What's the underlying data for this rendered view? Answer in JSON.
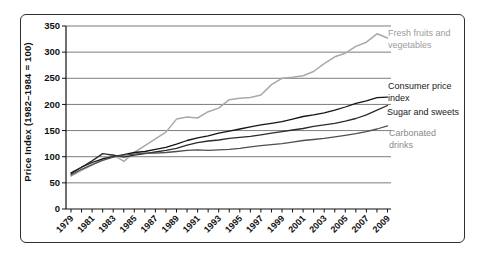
{
  "chart_data": {
    "type": "line",
    "title": "",
    "xlabel": "",
    "ylabel": "Price Index (1982–1984 = 100)",
    "ylim": [
      0,
      350
    ],
    "y_ticks": [
      0,
      50,
      100,
      150,
      200,
      250,
      300,
      350
    ],
    "grid": "horizontal",
    "legend_position": "right-of-line-annotations",
    "years": [
      1979,
      1980,
      1981,
      1982,
      1983,
      1984,
      1985,
      1986,
      1987,
      1988,
      1989,
      1990,
      1991,
      1992,
      1993,
      1994,
      1995,
      1996,
      1997,
      1998,
      1999,
      2000,
      2001,
      2002,
      2003,
      2004,
      2005,
      2006,
      2007,
      2008,
      2009
    ],
    "x_tick_labels": [
      1979,
      1981,
      1983,
      1985,
      1987,
      1989,
      1991,
      1993,
      1995,
      1997,
      1999,
      2001,
      2003,
      2005,
      2007,
      2009
    ],
    "series": [
      {
        "id": "fresh-fruits-vegetables",
        "label": "Fresh fruits and vegetables",
        "color": "#a9a9a9",
        "values": [
          63,
          74,
          84,
          96,
          104,
          91,
          108,
          121,
          134,
          147,
          172,
          176,
          174,
          186,
          193,
          209,
          212,
          213,
          218,
          238,
          250,
          252,
          255,
          263,
          278,
          291,
          298,
          311,
          319,
          335,
          327
        ]
      },
      {
        "id": "consumer-price-index",
        "label": "Consumer price index",
        "color": "#141414",
        "values": [
          69,
          80,
          89,
          96,
          100,
          104,
          108,
          110,
          114,
          118,
          124,
          131,
          136,
          140,
          145,
          149,
          153,
          157,
          161,
          164,
          167,
          172,
          177,
          180,
          184,
          189,
          195,
          202,
          207,
          213,
          214
        ]
      },
      {
        "id": "sugar-and-sweets",
        "label": "Sugar and sweets",
        "color": "#2b2b2b",
        "values": [
          67,
          80,
          92,
          106,
          103,
          99,
          103,
          106,
          109,
          112,
          116,
          122,
          127,
          130,
          132,
          135,
          137,
          139,
          142,
          145,
          148,
          151,
          154,
          158,
          161,
          164,
          168,
          173,
          180,
          189,
          198
        ]
      },
      {
        "id": "carbonated-drinks",
        "label": "Carbonated drinks",
        "color": "#4f4f4f",
        "values": [
          65,
          76,
          85,
          93,
          99,
          103,
          105,
          107,
          107,
          108,
          110,
          112,
          113,
          112,
          113,
          114,
          116,
          119,
          121,
          123,
          125,
          128,
          131,
          133,
          135,
          138,
          141,
          144,
          148,
          153,
          159
        ]
      }
    ]
  }
}
